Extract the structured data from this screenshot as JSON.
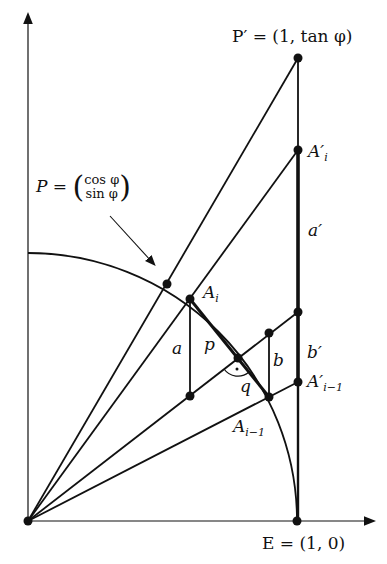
{
  "diagram": {
    "type": "geometric-construction",
    "colors": {
      "ink": "#111111",
      "background": "#ffffff"
    },
    "points": {
      "origin": {
        "x": 28,
        "y": 521
      },
      "E": {
        "label": "E = (1, 0)",
        "x": 297,
        "y": 521
      },
      "P_prime": {
        "label": "P′ = (1, tan φ)",
        "x": 298,
        "y": 58
      },
      "P": {
        "label_prefix": "P =",
        "vec_top": "cos φ",
        "vec_bottom": "sin φ",
        "x": 167,
        "y": 284
      },
      "A_i": {
        "label": "A",
        "sub": "i",
        "x": 190,
        "y": 299
      },
      "A_i_prime": {
        "label": "A′",
        "sub": "i",
        "x": 298,
        "y": 150
      },
      "A_im1": {
        "label": "A",
        "sub": "i−1",
        "x": 269,
        "y": 397
      },
      "A_im1_prime": {
        "label": "A′",
        "sub": "i−1",
        "x": 298,
        "y": 382
      },
      "M": {
        "x": 238,
        "y": 358
      },
      "a_foot": {
        "x": 190,
        "y": 396
      },
      "b_top": {
        "x": 269,
        "y": 333
      },
      "mid_tangent": {
        "x": 298,
        "y": 312
      }
    },
    "segment_labels": {
      "a": "a",
      "a_prime": "a′",
      "b": "b",
      "b_prime": "b′",
      "p": "p",
      "q": "q"
    },
    "right_angle_marker": "·"
  }
}
